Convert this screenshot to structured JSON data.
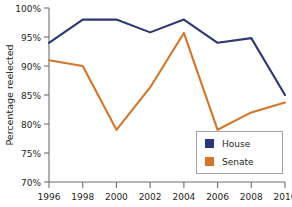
{
  "chart_data": {
    "type": "line",
    "title": "",
    "xlabel": "",
    "ylabel": "Percentage reelected",
    "x": [
      1996,
      1998,
      2000,
      2002,
      2004,
      2006,
      2008,
      2010
    ],
    "categories": [
      "1996",
      "1998",
      "2000",
      "2002",
      "2004",
      "2006",
      "2008",
      "2010"
    ],
    "series": [
      {
        "name": "House",
        "color": "#2c3775",
        "values": [
          94.0,
          98.0,
          98.0,
          95.8,
          98.0,
          94.0,
          94.8,
          85.0
        ]
      },
      {
        "name": "Senate",
        "color": "#d4762a",
        "values": [
          91.0,
          90.0,
          79.0,
          86.3,
          95.7,
          79.0,
          82.0,
          83.7
        ]
      }
    ],
    "ylim": [
      70,
      100
    ],
    "ytick_values": [
      70,
      75,
      80,
      85,
      90,
      95,
      100
    ],
    "ytick_labels": [
      "70%",
      "75%",
      "80%",
      "85%",
      "90%",
      "95%",
      "100%"
    ],
    "xtick_labels": [
      "1996",
      "1998",
      "2000",
      "2002",
      "2004",
      "2006",
      "2008",
      "2010"
    ],
    "grid": false,
    "legend_position": "lower-right"
  },
  "axes": {
    "y_title": "Percentage reelected",
    "y_ticks": [
      "100%",
      "95%",
      "90%",
      "85%",
      "80%",
      "75%",
      "70%"
    ],
    "x_ticks": [
      "1996",
      "1998",
      "2000",
      "2002",
      "2004",
      "2006",
      "2008",
      "2010"
    ]
  },
  "legend": {
    "entries": [
      {
        "label": "House",
        "swatch_color": "#2c3775"
      },
      {
        "label": "Senate",
        "swatch_color": "#d4762a"
      }
    ]
  },
  "colors": {
    "house": "#2c3775",
    "senate": "#d4762a",
    "axis": "#6d6e71",
    "text": "#231f20",
    "background": "#ffffff"
  }
}
